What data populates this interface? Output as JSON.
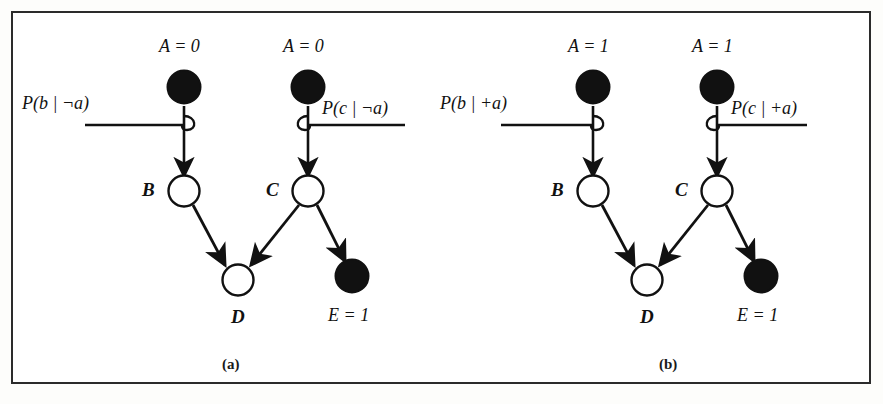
{
  "figure": {
    "kind": "bayesian-network-evidence-propagation",
    "background_color": "#ffffff",
    "ink_color": "#111111",
    "border_color": "#2b2b2b",
    "panels": [
      {
        "id": "a",
        "caption": "(a)",
        "nodes": {
          "a_left": {
            "label": "A = 1",
            "display_label": "A = 0",
            "var": "A",
            "value": "0",
            "shape": "circle",
            "fill": "filled",
            "evidence": true
          },
          "a_right": {
            "label": "A = 0",
            "display_label": "A = 0",
            "var": "A",
            "value": "0",
            "shape": "circle",
            "fill": "filled",
            "evidence": true
          },
          "b": {
            "display_label": "B",
            "var": "B",
            "shape": "circle",
            "fill": "open",
            "evidence": false
          },
          "c": {
            "display_label": "C",
            "var": "C",
            "shape": "circle",
            "fill": "open",
            "evidence": false
          },
          "d": {
            "display_label": "D",
            "var": "D",
            "shape": "circle",
            "fill": "open",
            "evidence": false
          },
          "e": {
            "display_label": "E = 1",
            "var": "E",
            "value": "1",
            "shape": "circle",
            "fill": "filled",
            "evidence": true
          }
        },
        "messages": {
          "left": {
            "text": "P(b | ¬a)",
            "p": "P",
            "open": "(",
            "arg": "b",
            "bar": "|",
            "sign": "¬",
            "cond": "a",
            "close": ")",
            "direction": "right-hook"
          },
          "right": {
            "text": "P(c | ¬a)",
            "p": "P",
            "open": "(",
            "arg": "c",
            "bar": "|",
            "sign": "¬",
            "cond": "a",
            "close": ")",
            "direction": "left-hook"
          }
        }
      },
      {
        "id": "b",
        "caption": "(b)",
        "nodes": {
          "a_left": {
            "display_label": "A = 1",
            "var": "A",
            "value": "1",
            "shape": "circle",
            "fill": "filled",
            "evidence": true
          },
          "a_right": {
            "display_label": "A = 1",
            "var": "A",
            "value": "1",
            "shape": "circle",
            "fill": "filled",
            "evidence": true
          },
          "b": {
            "display_label": "B",
            "var": "B",
            "shape": "circle",
            "fill": "open",
            "evidence": false
          },
          "c": {
            "display_label": "C",
            "var": "C",
            "shape": "circle",
            "fill": "open",
            "evidence": false
          },
          "d": {
            "display_label": "D",
            "var": "D",
            "shape": "circle",
            "fill": "open",
            "evidence": false
          },
          "e": {
            "display_label": "E = 1",
            "var": "E",
            "value": "1",
            "shape": "circle",
            "fill": "filled",
            "evidence": true
          }
        },
        "messages": {
          "left": {
            "text": "P(b | +a)",
            "p": "P",
            "open": "(",
            "arg": "b",
            "bar": "|",
            "sign": "+",
            "cond": "a",
            "close": ")",
            "direction": "right-hook"
          },
          "right": {
            "text": "P(c | +a)",
            "p": "P",
            "open": "(",
            "arg": "c",
            "bar": "|",
            "sign": "+",
            "cond": "a",
            "close": ")",
            "direction": "left-hook"
          }
        }
      }
    ],
    "edges": [
      {
        "from": "a_left",
        "to": "b",
        "arrow": true
      },
      {
        "from": "a_right",
        "to": "c",
        "arrow": true
      },
      {
        "from": "b",
        "to": "d",
        "arrow": true
      },
      {
        "from": "c",
        "to": "d",
        "arrow": true
      },
      {
        "from": "c",
        "to": "e",
        "arrow": true
      }
    ]
  }
}
